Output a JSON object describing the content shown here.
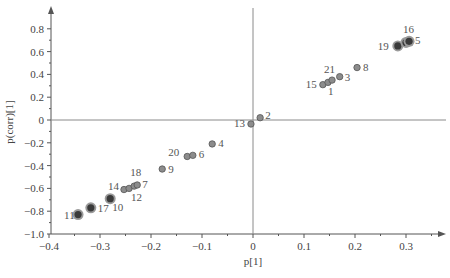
{
  "chart_data": {
    "type": "scatter",
    "title": "",
    "xlabel": "p[1]",
    "ylabel": "p(corr)[1]",
    "xlim": [
      -0.4,
      0.37
    ],
    "ylim": [
      -1.0,
      0.98
    ],
    "grid": false,
    "legend": null,
    "x_ticks": [
      -0.4,
      -0.3,
      -0.2,
      -0.1,
      0,
      0.1,
      0.2,
      0.3
    ],
    "x_tick_labels": [
      "−0.4",
      "−0.3",
      "−0.2",
      "−0.1",
      "0",
      "0.1",
      "0.2",
      "0.3"
    ],
    "y_ticks": [
      0.8,
      0.6,
      0.4,
      0.2,
      0,
      -0.2,
      -0.4,
      -0.6,
      -0.8,
      -1.0
    ],
    "y_tick_labels": [
      "0.8",
      "0.6",
      "0.4",
      "0.2",
      "0",
      "−0.2",
      "−0.4",
      "−0.6",
      "−0.8",
      "−1.0"
    ],
    "points": [
      {
        "label": "11",
        "x": -0.343,
        "y": -0.83,
        "style": "large",
        "lx": -14,
        "ly": 4
      },
      {
        "label": "17",
        "x": -0.318,
        "y": -0.77,
        "style": "large",
        "lx": 7,
        "ly": 4
      },
      {
        "label": "10",
        "x": -0.28,
        "y": -0.69,
        "style": "large",
        "lx": 2,
        "ly": 12
      },
      {
        "label": "14",
        "x": -0.253,
        "y": -0.61,
        "style": "small",
        "lx": -16,
        "ly": 0
      },
      {
        "label": "12",
        "x": -0.243,
        "y": -0.6,
        "style": "small",
        "lx": 2,
        "ly": 13
      },
      {
        "label": "18",
        "x": -0.233,
        "y": -0.58,
        "style": "small",
        "lx": -4,
        "ly": -10
      },
      {
        "label": "7",
        "x": -0.227,
        "y": -0.57,
        "style": "small",
        "lx": 5,
        "ly": 3
      },
      {
        "label": "9",
        "x": -0.178,
        "y": -0.43,
        "style": "small",
        "lx": 6,
        "ly": 4
      },
      {
        "label": "20",
        "x": -0.129,
        "y": -0.32,
        "style": "small",
        "lx": -19,
        "ly": 0
      },
      {
        "label": "6",
        "x": -0.118,
        "y": -0.31,
        "style": "small",
        "lx": 6,
        "ly": 3
      },
      {
        "label": "4",
        "x": -0.08,
        "y": -0.21,
        "style": "small",
        "lx": 6,
        "ly": 3
      },
      {
        "label": "13",
        "x": -0.004,
        "y": -0.035,
        "style": "small",
        "lx": -17,
        "ly": 3
      },
      {
        "label": "2",
        "x": 0.014,
        "y": 0.02,
        "style": "small",
        "lx": 5,
        "ly": 1
      },
      {
        "label": "15",
        "x": 0.137,
        "y": 0.31,
        "style": "small",
        "lx": -17,
        "ly": 3
      },
      {
        "label": "1",
        "x": 0.147,
        "y": 0.33,
        "style": "small",
        "lx": 0,
        "ly": 13
      },
      {
        "label": "21",
        "x": 0.155,
        "y": 0.35,
        "style": "small",
        "lx": -8,
        "ly": -7
      },
      {
        "label": "3",
        "x": 0.17,
        "y": 0.38,
        "style": "small",
        "lx": 5,
        "ly": 4
      },
      {
        "label": "8",
        "x": 0.204,
        "y": 0.46,
        "style": "small",
        "lx": 6,
        "ly": 3
      },
      {
        "label": "19",
        "x": 0.284,
        "y": 0.65,
        "style": "large",
        "lx": -20,
        "ly": 4
      },
      {
        "label": "16",
        "x": 0.3,
        "y": 0.68,
        "style": "large",
        "lx": -3,
        "ly": -9
      },
      {
        "label": "5",
        "x": 0.306,
        "y": 0.69,
        "style": "large",
        "lx": 6,
        "ly": 3
      }
    ]
  },
  "layout": {
    "x_zero_px": 253,
    "x_px_per_unit": 510,
    "y_zero_px": 120,
    "y_px_per_unit": 114,
    "x_axis_left": 51,
    "x_axis_right": 446,
    "y_axis_top": 6,
    "y_axis_bottom": 234
  },
  "colors": {
    "axis": "#555555",
    "point_small_fill": "#8c8c8c",
    "point_small_stroke": "#555555",
    "point_large_fill": "#3a3a3a",
    "point_large_halo": "#9a9a9a",
    "text": "#444444"
  }
}
